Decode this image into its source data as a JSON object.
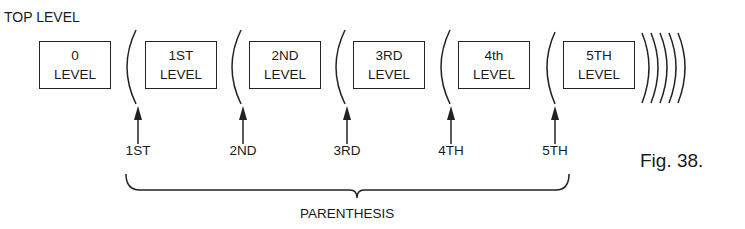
{
  "title": "TOP LEVEL",
  "levels": [
    {
      "line1": "0",
      "line2": "LEVEL",
      "x": 39
    },
    {
      "line1": "1ST",
      "line2": "LEVEL",
      "x": 145
    },
    {
      "line1": "2ND",
      "line2": "LEVEL",
      "x": 249
    },
    {
      "line1": "3RD",
      "line2": "LEVEL",
      "x": 353
    },
    {
      "line1": "4th",
      "line2": "LEVEL",
      "x": 458
    },
    {
      "line1": "5TH",
      "line2": "LEVEL",
      "x": 563
    }
  ],
  "parenthesis_markers": [
    {
      "label": "1ST",
      "x": 137
    },
    {
      "label": "2ND",
      "x": 242
    },
    {
      "label": "3RD",
      "x": 347
    },
    {
      "label": "4TH",
      "x": 451
    },
    {
      "label": "5TH",
      "x": 555
    }
  ],
  "brace_label": "PARENTHESIS",
  "figure_caption": "Fig. 38."
}
